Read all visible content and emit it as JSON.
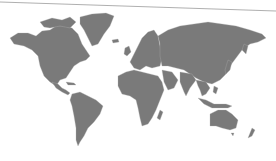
{
  "map": {
    "type": "world-political-silhouette",
    "land_color": "#7a7a7a",
    "border_color": "#b5b5b5",
    "background_color": "#ffffff",
    "top_rule_color": "#9a9a9a",
    "regions": [
      {
        "name": "north-america"
      },
      {
        "name": "greenland"
      },
      {
        "name": "central-america"
      },
      {
        "name": "south-america"
      },
      {
        "name": "europe"
      },
      {
        "name": "africa"
      },
      {
        "name": "madagascar"
      },
      {
        "name": "asia"
      },
      {
        "name": "arabian-peninsula"
      },
      {
        "name": "india"
      },
      {
        "name": "southeast-asia"
      },
      {
        "name": "indonesia"
      },
      {
        "name": "japan"
      },
      {
        "name": "australia"
      },
      {
        "name": "new-zealand"
      },
      {
        "name": "british-isles"
      },
      {
        "name": "iceland"
      }
    ]
  }
}
